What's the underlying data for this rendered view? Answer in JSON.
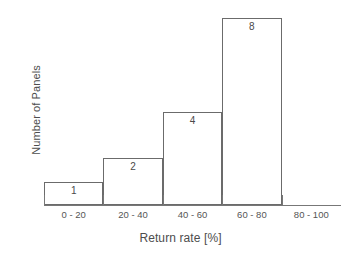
{
  "chart_data": {
    "type": "bar",
    "title": "",
    "subtitle": "",
    "xlabel": "Return rate [%]",
    "ylabel": "Number of Panels",
    "categories": [
      "0 - 20",
      "20 - 40",
      "40 - 60",
      "60 - 80",
      "80 - 100"
    ],
    "values": [
      1,
      2,
      4,
      8,
      0
    ],
    "value_labels": [
      "1",
      "2",
      "4",
      "8",
      ""
    ],
    "ylim": [
      0,
      8.3
    ],
    "grid": false,
    "legend": null,
    "y_tick_labels": [],
    "bar_style": {
      "fill": "#ffffff",
      "edge": "#6b6b6b",
      "gap": 0
    },
    "axis_color": "#777777",
    "text_color": "#4d4d4d",
    "background": "#ffffff",
    "annotations": []
  }
}
